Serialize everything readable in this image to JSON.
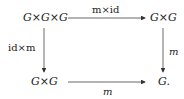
{
  "diagram": {
    "type": "commutative-square",
    "nodes": {
      "top_left": "G×G×G",
      "top_right": "G×G",
      "bottom_left": "G×G",
      "bottom_right": "G."
    },
    "arrows": {
      "top": {
        "from": "top_left",
        "to": "top_right",
        "label": "m×id"
      },
      "left": {
        "from": "top_left",
        "to": "bottom_left",
        "label": "id×m"
      },
      "right": {
        "from": "top_right",
        "to": "bottom_right",
        "label": "m"
      },
      "bottom": {
        "from": "bottom_left",
        "to": "bottom_right",
        "label": "m"
      }
    }
  }
}
